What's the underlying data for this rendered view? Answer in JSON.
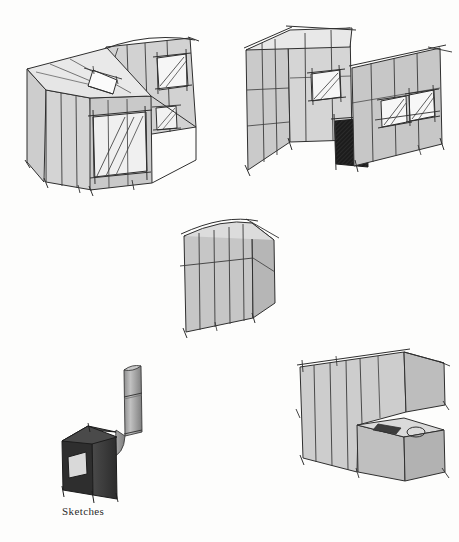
{
  "sheet": {
    "background_color": "#fdfdfc",
    "caption": "Sketches",
    "caption_color": "#2b2b2b"
  },
  "palette": {
    "ink": "#2f2f2f",
    "ink_light": "#555555",
    "wall_light": "#d6d6d6",
    "wall_mid": "#c4c4c4",
    "wall_dark": "#b0b0b0",
    "roof": "#e4e4e4",
    "roof_shadow": "#cfcfcf",
    "glass": "#f4f4f4",
    "dark_fill": "#1c1c1c",
    "stove_body": "#3a3a3a",
    "stove_top": "#4a4a4a",
    "flue": "#9a9a9a"
  },
  "drawings": [
    {
      "id": "sketch-1",
      "name": "axonometric-house-roof-deck",
      "title": "Axonometric — volume with roof terrace",
      "position": {
        "x": 18,
        "y": 28,
        "w": 200,
        "h": 165
      },
      "elements": [
        {
          "name": "main-volume",
          "type": "box"
        },
        {
          "name": "roof-deck",
          "type": "plane"
        },
        {
          "name": "roof-opening",
          "type": "skylight"
        },
        {
          "name": "tall-block",
          "type": "box"
        },
        {
          "name": "large-glazed-opening",
          "type": "window"
        },
        {
          "name": "upper-window",
          "type": "window"
        },
        {
          "name": "small-square-window",
          "type": "window"
        },
        {
          "name": "panel-seams",
          "type": "lines",
          "count": 9
        }
      ]
    },
    {
      "id": "sketch-2",
      "name": "axonometric-tower-and-wing",
      "title": "Axonometric — tower block with low wing",
      "position": {
        "x": 240,
        "y": 28,
        "w": 215,
        "h": 165
      },
      "elements": [
        {
          "name": "tower-volume",
          "type": "box"
        },
        {
          "name": "tower-roof",
          "type": "plane"
        },
        {
          "name": "entry-door",
          "type": "hatched-opening"
        },
        {
          "name": "tower-window",
          "type": "window"
        },
        {
          "name": "wing-volume",
          "type": "box"
        },
        {
          "name": "wing-window-left",
          "type": "window"
        },
        {
          "name": "wing-window-right",
          "type": "window"
        },
        {
          "name": "panel-seams",
          "type": "lines",
          "count": 11
        }
      ]
    },
    {
      "id": "sketch-3",
      "name": "slab-volume",
      "title": "Simple slab volume with curved roof",
      "position": {
        "x": 172,
        "y": 215,
        "w": 110,
        "h": 120
      },
      "elements": [
        {
          "name": "slab-front-face",
          "type": "plane"
        },
        {
          "name": "slab-side-face",
          "type": "plane"
        },
        {
          "name": "curved-roof-edge",
          "type": "curve"
        },
        {
          "name": "horizontal-band",
          "type": "line"
        },
        {
          "name": "panel-seams",
          "type": "lines",
          "count": 5
        }
      ]
    },
    {
      "id": "sketch-4",
      "name": "kitchen-wall-elevation",
      "title": "Kitchen wall — upper cabinet and counter",
      "position": {
        "x": 288,
        "y": 345,
        "w": 165,
        "h": 140
      },
      "elements": [
        {
          "name": "back-wall",
          "type": "plane"
        },
        {
          "name": "upper-cabinet",
          "type": "box"
        },
        {
          "name": "counter-unit",
          "type": "box"
        },
        {
          "name": "sink-basin",
          "type": "dark-rect"
        },
        {
          "name": "hob-ring",
          "type": "circle"
        },
        {
          "name": "panel-seams",
          "type": "lines",
          "count": 7
        }
      ]
    },
    {
      "id": "sketch-5",
      "name": "wood-stove-with-flue",
      "title": "Wood stove with flue pipe",
      "position": {
        "x": 58,
        "y": 358,
        "w": 105,
        "h": 130
      },
      "elements": [
        {
          "name": "stove-body",
          "type": "box"
        },
        {
          "name": "stove-top-plate",
          "type": "plane"
        },
        {
          "name": "stove-door-window",
          "type": "light-rect"
        },
        {
          "name": "flue-elbow",
          "type": "pipe"
        },
        {
          "name": "flue-vertical",
          "type": "pipe"
        },
        {
          "name": "flue-joint-bands",
          "type": "lines",
          "count": 3
        }
      ]
    }
  ]
}
